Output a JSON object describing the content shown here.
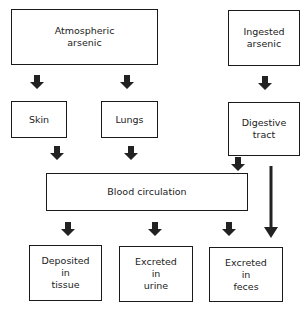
{
  "diagram": {
    "nodes": {
      "atmospheric": {
        "label": "Atmospheric\narsenic"
      },
      "ingested": {
        "label": "Ingested\narsenic"
      },
      "skin": {
        "label": "Skin"
      },
      "lungs": {
        "label": "Lungs"
      },
      "digestive": {
        "label": "Digestive\ntract"
      },
      "blood": {
        "label": "Blood circulation"
      },
      "tissue": {
        "label": "Deposited\nin\ntissue"
      },
      "urine": {
        "label": "Excreted\nin\nurine"
      },
      "feces": {
        "label": "Excreted\nin\nfeces"
      }
    },
    "edges": [
      {
        "from": "Atmospheric arsenic",
        "to": "Skin"
      },
      {
        "from": "Atmospheric arsenic",
        "to": "Lungs"
      },
      {
        "from": "Ingested arsenic",
        "to": "Digestive tract"
      },
      {
        "from": "Skin",
        "to": "Blood circulation"
      },
      {
        "from": "Lungs",
        "to": "Blood circulation"
      },
      {
        "from": "Digestive tract",
        "to": "Blood circulation"
      },
      {
        "from": "Digestive tract",
        "to": "Excreted in feces"
      },
      {
        "from": "Blood circulation",
        "to": "Deposited in tissue"
      },
      {
        "from": "Blood circulation",
        "to": "Excreted in urine"
      },
      {
        "from": "Blood circulation",
        "to": "Excreted in feces"
      }
    ],
    "colors": {
      "line": "#1a1a1a",
      "background": "#ffffff"
    }
  }
}
